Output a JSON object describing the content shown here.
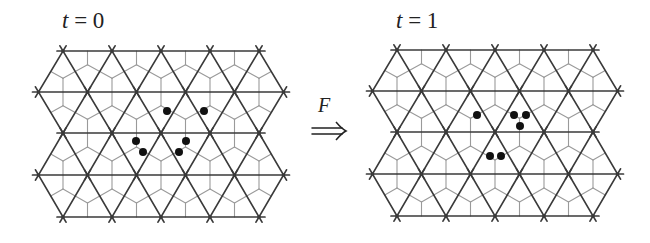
{
  "figure": {
    "width": 650,
    "height": 243,
    "colors": {
      "thick_line": "#3a3a3a",
      "thin_line": "#9a9a9a",
      "dot": "#111111",
      "text": "#222222",
      "background": "#ffffff"
    },
    "lattice_geometry": {
      "rows": 5,
      "dx": 49.0,
      "row_ys_offset": [
        0,
        41,
        82,
        124,
        166
      ],
      "row_node_counts": [
        5,
        6,
        5,
        6,
        5
      ],
      "row_x_shift": [
        0,
        -24.5,
        0,
        -24.5,
        0
      ],
      "stub_length": 6,
      "dot_radius": 4
    },
    "panels": [
      {
        "id": "t0",
        "title_var": "t",
        "title_rest": " = 0",
        "title_x": 62,
        "title_y": 8,
        "origin_x": 63,
        "origin_y": 51,
        "dots": [
          [
            167,
            111
          ],
          [
            204,
            111
          ],
          [
            136,
            141
          ],
          [
            143,
            152
          ],
          [
            186,
            141
          ],
          [
            179,
            152
          ]
        ]
      },
      {
        "id": "t1",
        "title_var": "t",
        "title_rest": " = 1",
        "title_x": 396,
        "title_y": 8,
        "origin_x": 397,
        "origin_y": 50,
        "dots": [
          [
            477,
            115
          ],
          [
            514,
            115
          ],
          [
            526,
            115
          ],
          [
            520,
            126
          ],
          [
            490,
            156
          ],
          [
            501,
            156
          ]
        ]
      }
    ],
    "map_arrow": {
      "label": "F",
      "glyph": "⇒",
      "label_x": 318,
      "label_y": 94,
      "arrow_x1": 312,
      "arrow_x2": 346,
      "arrow_y": 131
    }
  }
}
